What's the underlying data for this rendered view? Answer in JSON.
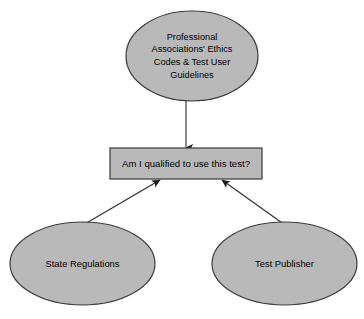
{
  "diagram": {
    "type": "flowchart",
    "background_color": "#ffffff",
    "node_fill_color": "#b9b9b9",
    "node_stroke_color": "#3a3a3a",
    "text_color": "#000000",
    "nodes": [
      {
        "id": "top-ellipse",
        "shape": "ellipse",
        "label": "Professional\nAssociations' Ethics\nCodes & Test User\nGuidelines"
      },
      {
        "id": "decision-box",
        "shape": "rectangle",
        "label": "Am I qualified to use this test?"
      },
      {
        "id": "left-ellipse",
        "shape": "ellipse",
        "label": "State Regulations"
      },
      {
        "id": "right-ellipse",
        "shape": "ellipse",
        "label": "Test Publisher"
      }
    ],
    "edges": [
      {
        "id": "edge-top-to-box",
        "from": "top-ellipse",
        "to": "decision-box",
        "direction": "down",
        "arrowhead": "filled-triangle"
      },
      {
        "id": "edge-left-to-box",
        "from": "left-ellipse",
        "to": "decision-box",
        "direction": "up-right",
        "arrowhead": "filled-triangle"
      },
      {
        "id": "edge-right-to-box",
        "from": "right-ellipse",
        "to": "decision-box",
        "direction": "up-left",
        "arrowhead": "filled-triangle"
      }
    ]
  }
}
